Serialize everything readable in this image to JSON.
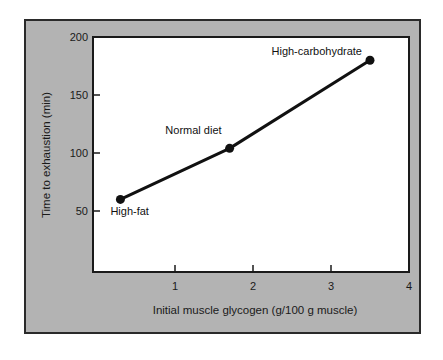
{
  "chart_data": {
    "type": "line",
    "title": "",
    "xlabel": "Initial muscle glycogen (g/100 g muscle)",
    "ylabel": "Time to exhaustion (min)",
    "xlim": [
      0,
      4
    ],
    "ylim": [
      0,
      200
    ],
    "x_ticks": [
      1,
      2,
      3,
      4
    ],
    "y_ticks": [
      50,
      100,
      150,
      200
    ],
    "grid": false,
    "legend": null,
    "series": [
      {
        "name": "Diet",
        "points": [
          {
            "label": "High-fat",
            "x": 0.3,
            "y": 60
          },
          {
            "label": "Normal diet",
            "x": 1.7,
            "y": 104
          },
          {
            "label": "High-carbohydrate",
            "x": 3.5,
            "y": 180
          }
        ]
      }
    ]
  },
  "colors": {
    "frame_bg": "#b3b3b3",
    "plot_bg": "#ffffff",
    "line": "#111111"
  }
}
